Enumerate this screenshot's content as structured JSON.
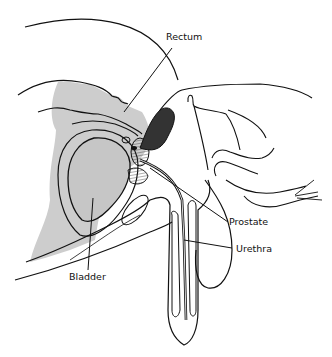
{
  "figure": {
    "colors": {
      "line": "#111111",
      "fill_shade": "#c9c9c9",
      "background": "#ffffff"
    }
  },
  "labels": {
    "rectum": "Rectum",
    "prostate": "Prostate",
    "urethra": "Urethra",
    "bladder": "Bladder"
  }
}
